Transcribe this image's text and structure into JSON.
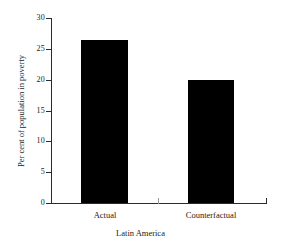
{
  "chart_data": {
    "type": "bar",
    "title": "",
    "subtitle": "",
    "categories": [
      "Actual",
      "Counterfactual"
    ],
    "values": [
      26.5,
      20.0
    ],
    "series": [
      {
        "name": "Per cent of population in poverty",
        "values": [
          26.5,
          20.0
        ]
      }
    ],
    "xlabel": "Latin America",
    "ylabel": "Per cent of population in poverty",
    "ylim": [
      0,
      30
    ],
    "yticks": [
      0,
      5,
      10,
      15,
      20,
      25,
      30
    ],
    "ytick_labels": [
      "0",
      "5",
      "10",
      "15",
      "20",
      "25",
      "30"
    ],
    "grid": false,
    "legend": false,
    "legend_position": "none",
    "bar_color": "#000000",
    "axis_color": "#2b2b2b",
    "background_color": "#ffffff"
  }
}
